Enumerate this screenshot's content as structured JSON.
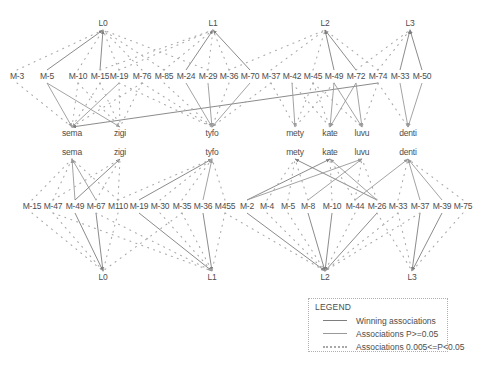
{
  "legend": {
    "title": "LEGEND",
    "items": [
      {
        "label": "Winning associations",
        "type": "win"
      },
      {
        "label": "Associations P>=0.05",
        "type": "p05"
      },
      {
        "label": "Associations 0.005<=P<0.05",
        "type": "dot"
      }
    ]
  },
  "diagram": {
    "width": 495,
    "height": 374,
    "styles": {
      "win": {
        "color": "#7e7e7e",
        "width": 0.9,
        "arrow": "arrow-win"
      },
      "p05": {
        "color": "#999999",
        "width": 0.9,
        "arrow": "arrow-p05"
      },
      "dot": {
        "color": "#aaaaaa",
        "width": 1.1,
        "dash": "1,5.3"
      }
    },
    "nodes": [
      {
        "id": "tL0",
        "label": "L0",
        "x": 103,
        "y": 24
      },
      {
        "id": "tL1",
        "label": "L1",
        "x": 213,
        "y": 24
      },
      {
        "id": "tL2",
        "label": "L2",
        "x": 325,
        "y": 24
      },
      {
        "id": "tL3",
        "label": "L3",
        "x": 410,
        "y": 24
      },
      {
        "id": "tM3",
        "label": "M-3",
        "x": 17,
        "y": 77
      },
      {
        "id": "tM5",
        "label": "M-5",
        "x": 47,
        "y": 77
      },
      {
        "id": "tM10",
        "label": "M-10",
        "x": 78,
        "y": 77
      },
      {
        "id": "tM15",
        "label": "M-15",
        "x": 100,
        "y": 77
      },
      {
        "id": "tM19",
        "label": "M-19",
        "x": 119,
        "y": 77
      },
      {
        "id": "tM76",
        "label": "M-76",
        "x": 142,
        "y": 77
      },
      {
        "id": "tM85",
        "label": "M-85",
        "x": 164,
        "y": 77
      },
      {
        "id": "tM24",
        "label": "M-24",
        "x": 186,
        "y": 77
      },
      {
        "id": "tM29",
        "label": "M-29",
        "x": 208,
        "y": 77
      },
      {
        "id": "tM36",
        "label": "M-36",
        "x": 229,
        "y": 77
      },
      {
        "id": "tM70",
        "label": "M-70",
        "x": 250,
        "y": 77
      },
      {
        "id": "tM37",
        "label": "M-37",
        "x": 271,
        "y": 77
      },
      {
        "id": "tM42",
        "label": "M-42",
        "x": 292,
        "y": 77
      },
      {
        "id": "tM45",
        "label": "M-45",
        "x": 313,
        "y": 77
      },
      {
        "id": "tM49",
        "label": "M-49",
        "x": 334,
        "y": 77
      },
      {
        "id": "tM72",
        "label": "M-72",
        "x": 356,
        "y": 77
      },
      {
        "id": "tM74",
        "label": "M-74",
        "x": 378,
        "y": 77
      },
      {
        "id": "tM33",
        "label": "M-33",
        "x": 400,
        "y": 77
      },
      {
        "id": "tM50",
        "label": "M-50",
        "x": 422,
        "y": 77
      },
      {
        "id": "n1sema",
        "label": "sema",
        "x": 72,
        "y": 134
      },
      {
        "id": "n1zigi",
        "label": "zigi",
        "x": 120,
        "y": 134
      },
      {
        "id": "n1tyfo",
        "label": "tyfo",
        "x": 212,
        "y": 134
      },
      {
        "id": "n1mety",
        "label": "mety",
        "x": 295,
        "y": 134
      },
      {
        "id": "n1kate",
        "label": "kate",
        "x": 330,
        "y": 134
      },
      {
        "id": "n1luvu",
        "label": "luvu",
        "x": 362,
        "y": 134
      },
      {
        "id": "n1denti",
        "label": "denti",
        "x": 408,
        "y": 134
      },
      {
        "id": "n2sema",
        "label": "sema",
        "x": 72,
        "y": 153
      },
      {
        "id": "n2zigi",
        "label": "zigi",
        "x": 120,
        "y": 153
      },
      {
        "id": "n2tyfo",
        "label": "tyfo",
        "x": 212,
        "y": 153
      },
      {
        "id": "n2mety",
        "label": "mety",
        "x": 295,
        "y": 153
      },
      {
        "id": "n2kate",
        "label": "kate",
        "x": 330,
        "y": 153
      },
      {
        "id": "n2luvu",
        "label": "luvu",
        "x": 362,
        "y": 153
      },
      {
        "id": "n2denti",
        "label": "denti",
        "x": 408,
        "y": 153
      },
      {
        "id": "bM15",
        "label": "M-15",
        "x": 32,
        "y": 207
      },
      {
        "id": "bM47",
        "label": "M-47",
        "x": 53,
        "y": 207
      },
      {
        "id": "bM49",
        "label": "M-49",
        "x": 75,
        "y": 207
      },
      {
        "id": "bM67",
        "label": "M-67",
        "x": 96,
        "y": 207
      },
      {
        "id": "bM110",
        "label": "M110",
        "x": 118,
        "y": 207
      },
      {
        "id": "bM19",
        "label": "M-19",
        "x": 139,
        "y": 207
      },
      {
        "id": "bM30",
        "label": "M-30",
        "x": 160,
        "y": 207
      },
      {
        "id": "bM35",
        "label": "M-35",
        "x": 182,
        "y": 207
      },
      {
        "id": "bM36",
        "label": "M-36",
        "x": 203,
        "y": 207
      },
      {
        "id": "bM455",
        "label": "M455",
        "x": 225,
        "y": 207
      },
      {
        "id": "bM2",
        "label": "M-2",
        "x": 247,
        "y": 207
      },
      {
        "id": "bM4",
        "label": "M-4",
        "x": 267,
        "y": 207
      },
      {
        "id": "bM5",
        "label": "M-5",
        "x": 288,
        "y": 207
      },
      {
        "id": "bM8",
        "label": "M-8",
        "x": 308,
        "y": 207
      },
      {
        "id": "bM10",
        "label": "M-10",
        "x": 332,
        "y": 207
      },
      {
        "id": "bM44",
        "label": "M-44",
        "x": 355,
        "y": 207
      },
      {
        "id": "bM26",
        "label": "M-26",
        "x": 377,
        "y": 207
      },
      {
        "id": "bM33",
        "label": "M-33",
        "x": 398,
        "y": 207
      },
      {
        "id": "bM37",
        "label": "M-37",
        "x": 420,
        "y": 207
      },
      {
        "id": "bM39",
        "label": "M-39",
        "x": 442,
        "y": 207
      },
      {
        "id": "bM75",
        "label": "M-75",
        "x": 463,
        "y": 207
      },
      {
        "id": "bL0",
        "label": "L0",
        "x": 103,
        "y": 278
      },
      {
        "id": "bL1",
        "label": "L1",
        "x": 212,
        "y": 278
      },
      {
        "id": "bL2",
        "label": "L2",
        "x": 325,
        "y": 278
      },
      {
        "id": "bL3",
        "label": "L3",
        "x": 412,
        "y": 278
      }
    ],
    "edges": [
      {
        "a": "tL0",
        "b": "tM5",
        "t": "win"
      },
      {
        "a": "tL0",
        "b": "tM15",
        "t": "win"
      },
      {
        "a": "tL1",
        "b": "tM24",
        "t": "win"
      },
      {
        "a": "tL1",
        "b": "tM70",
        "t": "win"
      },
      {
        "a": "tL2",
        "b": "tM49",
        "t": "win"
      },
      {
        "a": "tL2",
        "b": "tM72",
        "t": "win"
      },
      {
        "a": "tL3",
        "b": "tM33",
        "t": "win"
      },
      {
        "a": "tL3",
        "b": "tM50",
        "t": "win"
      },
      {
        "a": "n1sema",
        "b": "tM5",
        "t": "p05"
      },
      {
        "a": "n1sema",
        "b": "tM19",
        "t": "p05"
      },
      {
        "a": "n1sema",
        "b": "tM74",
        "t": "win"
      },
      {
        "a": "n1zigi",
        "b": "tM5",
        "t": "p05"
      },
      {
        "a": "n1tyfo",
        "b": "tM24",
        "t": "p05"
      },
      {
        "a": "n1tyfo",
        "b": "tM29",
        "t": "p05"
      },
      {
        "a": "n1tyfo",
        "b": "tM70",
        "t": "p05"
      },
      {
        "a": "n1mety",
        "b": "tM42",
        "t": "p05"
      },
      {
        "a": "n1kate",
        "b": "tM49",
        "t": "p05"
      },
      {
        "a": "n1kate",
        "b": "tM72",
        "t": "p05"
      },
      {
        "a": "n1luvu",
        "b": "tM49",
        "t": "p05"
      },
      {
        "a": "n1luvu",
        "b": "tM72",
        "t": "p05"
      },
      {
        "a": "n1denti",
        "b": "tM33",
        "t": "p05"
      },
      {
        "a": "n1denti",
        "b": "tM50",
        "t": "p05"
      },
      {
        "a": "n2sema",
        "b": "bM49",
        "t": "p05"
      },
      {
        "a": "n2sema",
        "b": "bM67",
        "t": "p05"
      },
      {
        "a": "n2zigi",
        "b": "bM49",
        "t": "win"
      },
      {
        "a": "n2tyfo",
        "b": "bM19",
        "t": "win"
      },
      {
        "a": "n2tyfo",
        "b": "bM36",
        "t": "p05"
      },
      {
        "a": "n2mety",
        "b": "bM26",
        "t": "win"
      },
      {
        "a": "n2kate",
        "b": "bM2",
        "t": "win"
      },
      {
        "a": "n2kate",
        "b": "bM26",
        "t": "p05"
      },
      {
        "a": "n2luvu",
        "b": "bM2",
        "t": "p05"
      },
      {
        "a": "n2luvu",
        "b": "bM8",
        "t": "p05"
      },
      {
        "a": "n2denti",
        "b": "bM44",
        "t": "p05"
      },
      {
        "a": "n2denti",
        "b": "bM37",
        "t": "p05"
      },
      {
        "a": "n2denti",
        "b": "bM39",
        "t": "p05"
      },
      {
        "a": "bL0",
        "b": "bM49",
        "t": "win"
      },
      {
        "a": "bL0",
        "b": "bM67",
        "t": "win"
      },
      {
        "a": "bL1",
        "b": "bM19",
        "t": "win"
      },
      {
        "a": "bL1",
        "b": "bM36",
        "t": "win"
      },
      {
        "a": "bL2",
        "b": "bM2",
        "t": "win"
      },
      {
        "a": "bL2",
        "b": "bM8",
        "t": "win"
      },
      {
        "a": "bL2",
        "b": "bM10",
        "t": "win"
      },
      {
        "a": "bL2",
        "b": "bM26",
        "t": "win"
      },
      {
        "a": "bL3",
        "b": "bM37",
        "t": "win"
      },
      {
        "a": "bL3",
        "b": "bM39",
        "t": "win"
      },
      {
        "a": "tL0",
        "b": "tM3",
        "t": "dot"
      },
      {
        "a": "tL0",
        "b": "tM10",
        "t": "dot"
      },
      {
        "a": "tL0",
        "b": "tM19",
        "t": "dot"
      },
      {
        "a": "tL0",
        "b": "tM76",
        "t": "dot"
      },
      {
        "a": "tL0",
        "b": "tM85",
        "t": "dot"
      },
      {
        "a": "tL0",
        "b": "tM29",
        "t": "dot"
      },
      {
        "a": "tL1",
        "b": "tM15",
        "t": "dot"
      },
      {
        "a": "tL1",
        "b": "tM19",
        "t": "dot"
      },
      {
        "a": "tL1",
        "b": "tM85",
        "t": "dot"
      },
      {
        "a": "tL1",
        "b": "tM29",
        "t": "dot"
      },
      {
        "a": "tL1",
        "b": "tM36",
        "t": "dot"
      },
      {
        "a": "tL2",
        "b": "tM36",
        "t": "dot"
      },
      {
        "a": "tL2",
        "b": "tM45",
        "t": "dot"
      },
      {
        "a": "tL2",
        "b": "tM37",
        "t": "dot"
      },
      {
        "a": "tL2",
        "b": "tM74",
        "t": "dot"
      },
      {
        "a": "tL3",
        "b": "tM72",
        "t": "dot"
      },
      {
        "a": "tL3",
        "b": "tM74",
        "t": "dot"
      },
      {
        "a": "n1sema",
        "b": "tM3",
        "t": "dot"
      },
      {
        "a": "n1sema",
        "b": "tM10",
        "t": "dot"
      },
      {
        "a": "n1sema",
        "b": "tM15",
        "t": "dot"
      },
      {
        "a": "n1sema",
        "b": "tM76",
        "t": "dot"
      },
      {
        "a": "n1zigi",
        "b": "tM10",
        "t": "dot"
      },
      {
        "a": "n1zigi",
        "b": "tM15",
        "t": "dot"
      },
      {
        "a": "n1zigi",
        "b": "tM19",
        "t": "dot"
      },
      {
        "a": "n1zigi",
        "b": "tM76",
        "t": "dot"
      },
      {
        "a": "n1tyfo",
        "b": "tM76",
        "t": "dot"
      },
      {
        "a": "n1tyfo",
        "b": "tM85",
        "t": "dot"
      },
      {
        "a": "n1tyfo",
        "b": "tM36",
        "t": "dot"
      },
      {
        "a": "n1tyfo",
        "b": "tM19",
        "t": "dot"
      },
      {
        "a": "n1tyfo",
        "b": "tM37",
        "t": "dot"
      },
      {
        "a": "n1mety",
        "b": "tM37",
        "t": "dot"
      },
      {
        "a": "n1mety",
        "b": "tM45",
        "t": "dot"
      },
      {
        "a": "n1mety",
        "b": "tM49",
        "t": "dot"
      },
      {
        "a": "n1kate",
        "b": "tM42",
        "t": "dot"
      },
      {
        "a": "n1kate",
        "b": "tM45",
        "t": "dot"
      },
      {
        "a": "n1luvu",
        "b": "tM45",
        "t": "dot"
      },
      {
        "a": "n1luvu",
        "b": "tM74",
        "t": "dot"
      },
      {
        "a": "n1denti",
        "b": "tM74",
        "t": "dot"
      },
      {
        "a": "n2sema",
        "b": "bM15",
        "t": "dot"
      },
      {
        "a": "n2sema",
        "b": "bM47",
        "t": "dot"
      },
      {
        "a": "n2sema",
        "b": "bM110",
        "t": "dot"
      },
      {
        "a": "n2zigi",
        "b": "bM47",
        "t": "dot"
      },
      {
        "a": "n2zigi",
        "b": "bM67",
        "t": "dot"
      },
      {
        "a": "n2zigi",
        "b": "bM110",
        "t": "dot"
      },
      {
        "a": "n2tyfo",
        "b": "bM30",
        "t": "dot"
      },
      {
        "a": "n2tyfo",
        "b": "bM35",
        "t": "dot"
      },
      {
        "a": "n2tyfo",
        "b": "bM455",
        "t": "dot"
      },
      {
        "a": "n2tyfo",
        "b": "bM110",
        "t": "dot"
      },
      {
        "a": "n2mety",
        "b": "bM4",
        "t": "dot"
      },
      {
        "a": "n2mety",
        "b": "bM5",
        "t": "dot"
      },
      {
        "a": "n2mety",
        "b": "bM8",
        "t": "dot"
      },
      {
        "a": "n2kate",
        "b": "bM10",
        "t": "dot"
      },
      {
        "a": "n2kate",
        "b": "bM44",
        "t": "dot"
      },
      {
        "a": "n2luvu",
        "b": "bM44",
        "t": "dot"
      },
      {
        "a": "n2luvu",
        "b": "bM26",
        "t": "dot"
      },
      {
        "a": "n2denti",
        "b": "bM33",
        "t": "dot"
      },
      {
        "a": "n2denti",
        "b": "bM75",
        "t": "dot"
      },
      {
        "a": "bL0",
        "b": "bM15",
        "t": "dot"
      },
      {
        "a": "bL0",
        "b": "bM47",
        "t": "dot"
      },
      {
        "a": "bL0",
        "b": "bM110",
        "t": "dot"
      },
      {
        "a": "bL0",
        "b": "bM35",
        "t": "dot"
      },
      {
        "a": "bL1",
        "b": "bM30",
        "t": "dot"
      },
      {
        "a": "bL1",
        "b": "bM35",
        "t": "dot"
      },
      {
        "a": "bL1",
        "b": "bM455",
        "t": "dot"
      },
      {
        "a": "bL1",
        "b": "bM47",
        "t": "dot"
      },
      {
        "a": "bL1",
        "b": "bM67",
        "t": "dot"
      },
      {
        "a": "bL2",
        "b": "bM4",
        "t": "dot"
      },
      {
        "a": "bL2",
        "b": "bM5",
        "t": "dot"
      },
      {
        "a": "bL2",
        "b": "bM44",
        "t": "dot"
      },
      {
        "a": "bL2",
        "b": "bM33",
        "t": "dot"
      },
      {
        "a": "bL2",
        "b": "bM455",
        "t": "dot"
      },
      {
        "a": "bL2",
        "b": "bM37",
        "t": "dot"
      },
      {
        "a": "bL3",
        "b": "bM33",
        "t": "dot"
      },
      {
        "a": "bL3",
        "b": "bM75",
        "t": "dot"
      },
      {
        "a": "bL3",
        "b": "bM26",
        "t": "dot"
      }
    ]
  }
}
